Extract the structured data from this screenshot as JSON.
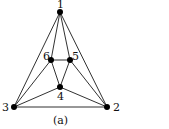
{
  "diagram": {
    "caption": "(a)",
    "nodes": [
      {
        "id": "1",
        "label": "1",
        "x": 60,
        "y": 12,
        "lx": 57,
        "ly": 8
      },
      {
        "id": "2",
        "label": "2",
        "x": 107,
        "y": 107,
        "lx": 113,
        "ly": 111
      },
      {
        "id": "3",
        "label": "3",
        "x": 14,
        "y": 107,
        "lx": 2,
        "ly": 111
      },
      {
        "id": "4",
        "label": "4",
        "x": 60,
        "y": 87,
        "lx": 57,
        "ly": 100
      },
      {
        "id": "5",
        "label": "5",
        "x": 70,
        "y": 60,
        "lx": 72,
        "ly": 60
      },
      {
        "id": "6",
        "label": "6",
        "x": 51,
        "y": 60,
        "lx": 43,
        "ly": 60
      }
    ],
    "edges": [
      [
        "1",
        "3"
      ],
      [
        "1",
        "2"
      ],
      [
        "1",
        "6"
      ],
      [
        "1",
        "5"
      ],
      [
        "3",
        "2"
      ],
      [
        "3",
        "6"
      ],
      [
        "3",
        "4"
      ],
      [
        "2",
        "5"
      ],
      [
        "2",
        "4"
      ],
      [
        "6",
        "5"
      ],
      [
        "6",
        "4"
      ],
      [
        "5",
        "4"
      ]
    ],
    "colors": {
      "node": "#000000",
      "edge": "#1a1a1a",
      "text": "#111111",
      "background": "#ffffff"
    }
  }
}
